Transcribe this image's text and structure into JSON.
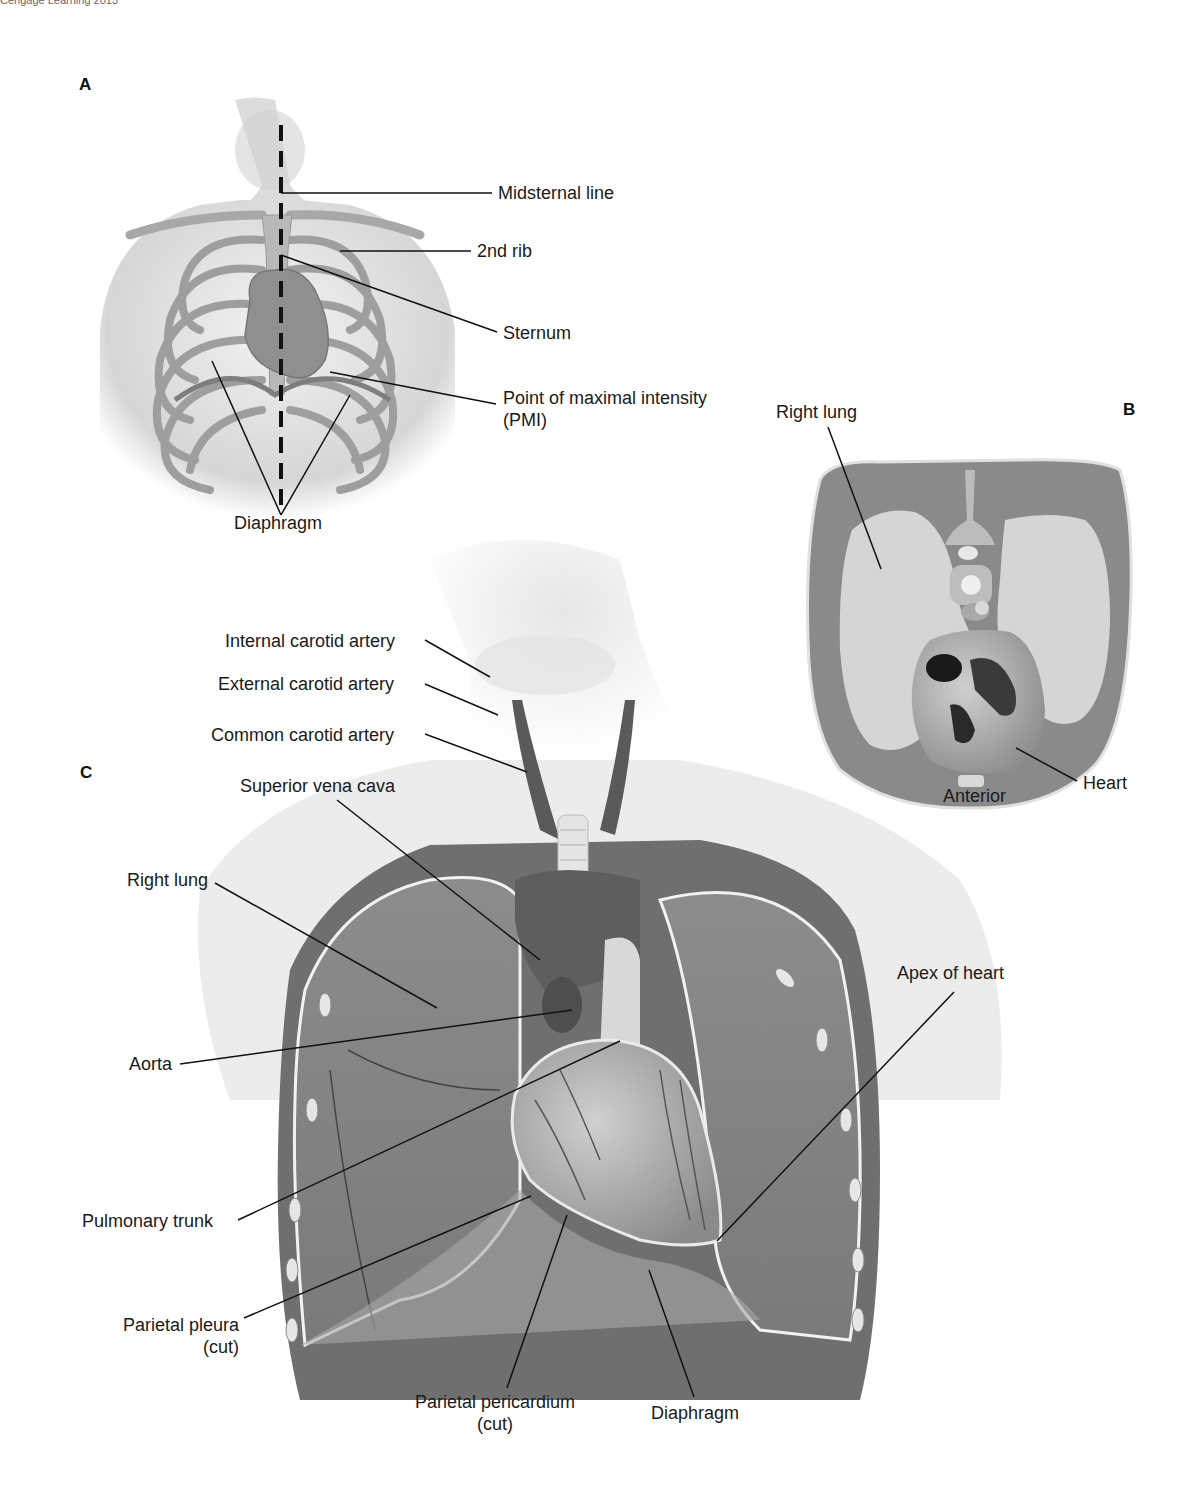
{
  "credit": "Cengage Learning 2013",
  "panels": {
    "A": {
      "letter": "A",
      "labels": {
        "midsternal_line": "Midsternal line",
        "second_rib": "2nd rib",
        "sternum": "Sternum",
        "pmi_line1": "Point of maximal intensity",
        "pmi_line2": "(PMI)",
        "diaphragm": "Diaphragm"
      }
    },
    "B": {
      "letter": "B",
      "labels": {
        "right_lung": "Right lung",
        "heart": "Heart",
        "anterior": "Anterior"
      }
    },
    "C": {
      "letter": "C",
      "labels": {
        "internal_carotid": "Internal carotid artery",
        "external_carotid": "External carotid artery",
        "common_carotid": "Common carotid artery",
        "superior_vena_cava": "Superior vena cava",
        "right_lung": "Right lung",
        "aorta": "Aorta",
        "pulmonary_trunk": "Pulmonary trunk",
        "parietal_pleura_line1": "Parietal pleura",
        "parietal_pleura_line2": "(cut)",
        "apex_of_heart": "Apex of heart",
        "parietal_pericardium_line1": "Parietal pericardium",
        "parietal_pericardium_line2": "(cut)",
        "diaphragm": "Diaphragm"
      }
    }
  },
  "colors": {
    "skin": "#d9d9d9",
    "tissue": "#8a8a8a",
    "lung_light": "#cfcfcf",
    "lung_dark": "#7d7d7d",
    "bone": "#bdbdbd",
    "heart": "#9a9a9a",
    "leader_line": "#111111"
  }
}
